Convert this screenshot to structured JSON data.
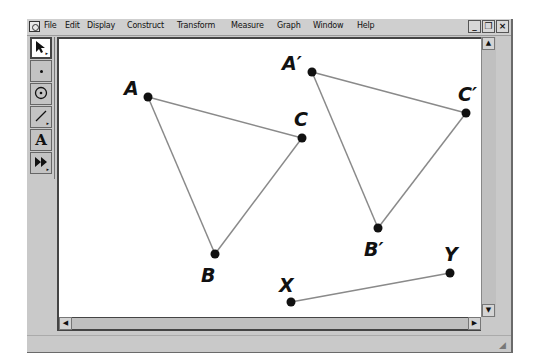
{
  "menubar": {
    "items": [
      "File",
      "Edit",
      "Display",
      "Construct",
      "Transform",
      "Measure",
      "Graph",
      "Window",
      "Help"
    ],
    "window_buttons": {
      "minimize": "_",
      "restore": "❐",
      "close": "×"
    }
  },
  "toolbox": {
    "tools": [
      {
        "name": "arrow-tool",
        "glyph": "➤"
      },
      {
        "name": "point-tool",
        "glyph": "•"
      },
      {
        "name": "compass-tool",
        "glyph": "⊙"
      },
      {
        "name": "straightedge-tool",
        "glyph": "╱"
      },
      {
        "name": "text-tool",
        "glyph": "A"
      },
      {
        "name": "custom-tool",
        "glyph": "⏩"
      }
    ]
  },
  "canvas": {
    "points": [
      {
        "label": "A",
        "x": 146,
        "y": 95
      },
      {
        "label": "B",
        "x": 213,
        "y": 252
      },
      {
        "label": "C",
        "x": 300,
        "y": 136
      },
      {
        "label": "A′",
        "x": 310,
        "y": 70
      },
      {
        "label": "B′",
        "x": 376,
        "y": 226
      },
      {
        "label": "C′",
        "x": 464,
        "y": 111
      },
      {
        "label": "X",
        "x": 289,
        "y": 300
      },
      {
        "label": "Y",
        "x": 448,
        "y": 271
      }
    ],
    "segments": [
      [
        "A",
        "B"
      ],
      [
        "B",
        "C"
      ],
      [
        "C",
        "A"
      ],
      [
        "A′",
        "B′"
      ],
      [
        "B′",
        "C′"
      ],
      [
        "C′",
        "A′"
      ],
      [
        "X",
        "Y"
      ]
    ],
    "line_color": "#8a8a8a",
    "point_color": "#111111"
  },
  "scroll": {
    "up": "▲",
    "down": "▼",
    "left": "◀",
    "right": "▶"
  }
}
